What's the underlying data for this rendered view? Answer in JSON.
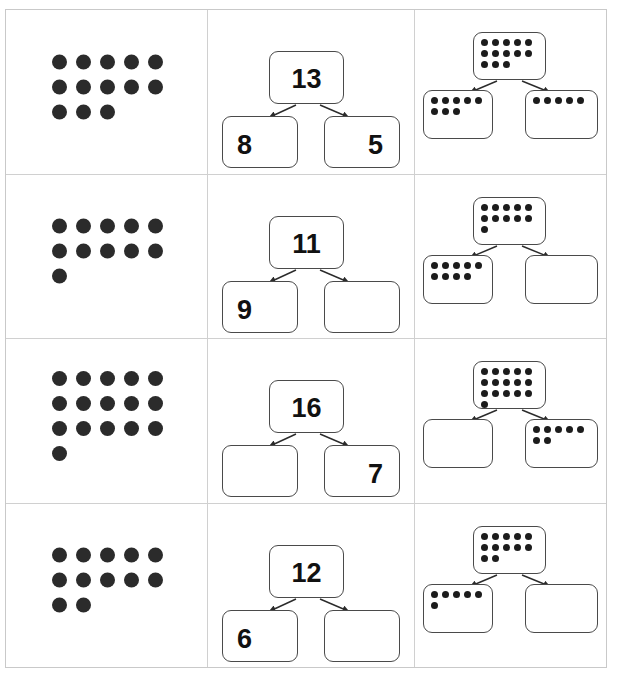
{
  "worksheet": {
    "title": "Number bond worksheet",
    "dot_color": "#2b2b2b",
    "box_border_color": "#4a4a4a",
    "grid_color": "#d0d0d0",
    "rows": [
      {
        "row_label": "row-1",
        "dot_array": {
          "total": 13,
          "rows": [
            5,
            5,
            3
          ]
        },
        "number_bond": {
          "whole": "13",
          "part_left": "8",
          "part_right": "5"
        },
        "dot_bond": {
          "whole": {
            "total": 13,
            "rows": [
              5,
              5,
              3
            ]
          },
          "part_left": {
            "total": 8,
            "rows": [
              5,
              3
            ]
          },
          "part_right": {
            "total": 5,
            "rows": [
              5
            ]
          }
        }
      },
      {
        "row_label": "row-2",
        "dot_array": {
          "total": 11,
          "rows": [
            5,
            5,
            1
          ]
        },
        "number_bond": {
          "whole": "11",
          "part_left": "9",
          "part_right": ""
        },
        "dot_bond": {
          "whole": {
            "total": 11,
            "rows": [
              5,
              5,
              1
            ]
          },
          "part_left": {
            "total": 9,
            "rows": [
              5,
              4
            ]
          },
          "part_right": {
            "total": 0,
            "rows": []
          }
        }
      },
      {
        "row_label": "row-3",
        "dot_array": {
          "total": 16,
          "rows": [
            5,
            5,
            5,
            1
          ]
        },
        "number_bond": {
          "whole": "16",
          "part_left": "",
          "part_right": "7"
        },
        "dot_bond": {
          "whole": {
            "total": 16,
            "rows": [
              5,
              5,
              5,
              1
            ]
          },
          "part_left": {
            "total": 0,
            "rows": []
          },
          "part_right": {
            "total": 7,
            "rows": [
              5,
              2
            ]
          }
        }
      },
      {
        "row_label": "row-4",
        "dot_array": {
          "total": 12,
          "rows": [
            5,
            5,
            2
          ]
        },
        "number_bond": {
          "whole": "12",
          "part_left": "6",
          "part_right": ""
        },
        "dot_bond": {
          "whole": {
            "total": 12,
            "rows": [
              5,
              5,
              2
            ]
          },
          "part_left": {
            "total": 6,
            "rows": [
              5,
              1
            ]
          },
          "part_right": {
            "total": 0,
            "rows": []
          }
        }
      }
    ]
  }
}
